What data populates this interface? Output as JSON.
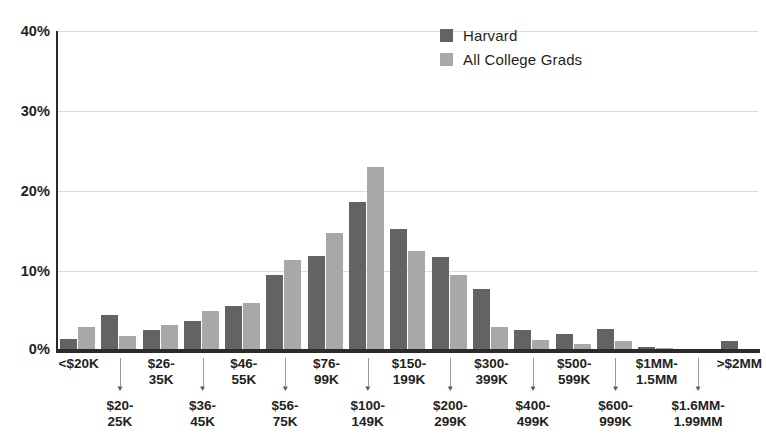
{
  "chart_data": {
    "type": "bar",
    "title": "",
    "subtitle": "",
    "xlabel": "",
    "ylabel": "",
    "ylim": [
      0,
      40
    ],
    "yticks": [
      0,
      10,
      20,
      30,
      40
    ],
    "ytick_labels": [
      "0%",
      "10%",
      "20%",
      "30%",
      "40%"
    ],
    "grid": true,
    "legend_position": "top-right",
    "categories": [
      "<$20K",
      "$20-25K",
      "$26-35K",
      "$36-45K",
      "$46-55K",
      "$56-75K",
      "$76-99K",
      "$100-149K",
      "$150-199K",
      "$200-299K",
      "$300-399K",
      "$400-499K",
      "$500-599K",
      "$600-999K",
      "$1MM-1.5MM",
      "$1.6MM-1.99MM",
      ">$2MM"
    ],
    "series": [
      {
        "name": "Harvard",
        "color": "#636363",
        "values": [
          1.5,
          4.5,
          2.6,
          3.7,
          5.6,
          9.5,
          11.9,
          18.6,
          15.3,
          11.8,
          7.8,
          2.6,
          2.1,
          2.8,
          0.5,
          0.0,
          1.2
        ]
      },
      {
        "name": "All College Grads",
        "color": "#a8a8a8",
        "values": [
          3.0,
          1.9,
          3.2,
          5.0,
          6.0,
          11.4,
          14.8,
          23.0,
          12.5,
          9.5,
          3.0,
          1.4,
          0.9,
          1.3,
          0.4,
          0.0,
          0.0
        ]
      }
    ]
  },
  "legend": {
    "items": [
      {
        "label": "Harvard",
        "color": "#636363"
      },
      {
        "label": "All College Grads",
        "color": "#a8a8a8"
      }
    ]
  },
  "axis": {
    "y_ticks": [
      "40%",
      "30%",
      "20%",
      "10%",
      "0%"
    ],
    "x_labels_top": [
      "<$20K",
      "$26-\n35K",
      "$46-\n55K",
      "$76-\n99K",
      "$150-\n199K",
      "$300-\n399K",
      "$500-\n599K",
      "$1MM-\n1.5MM",
      ">$2MM"
    ],
    "x_labels_bottom": [
      "$20-\n25K",
      "$36-\n45K",
      "$56-\n75K",
      "$100-\n149K",
      "$200-\n299K",
      "$400-\n499K",
      "$600-\n999K",
      "$1.6MM-\n1.99MM"
    ]
  }
}
